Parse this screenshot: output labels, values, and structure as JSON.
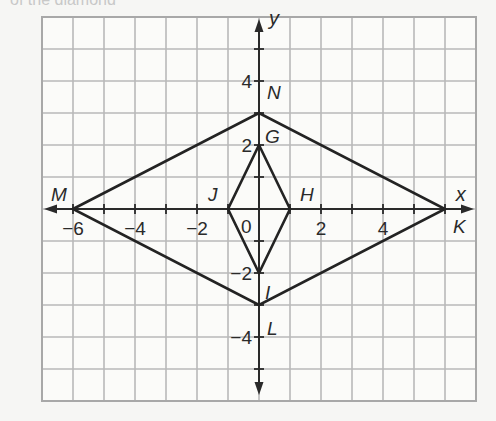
{
  "header_fragment": "of the diamond",
  "diagram": {
    "type": "coordinate-plane",
    "grid": {
      "x_min": -7,
      "x_max": 7,
      "y_min": -6,
      "y_max": 6,
      "step": 1,
      "line_color": "#b9b9b9",
      "border_color": "#a8a8a8"
    },
    "axes": {
      "x_label": "x",
      "y_label": "y",
      "color": "#2a2a2a"
    },
    "tick_labels": {
      "x": [
        {
          "value": -6,
          "text": "−6"
        },
        {
          "value": -4,
          "text": "−4"
        },
        {
          "value": -2,
          "text": "−2"
        },
        {
          "value": 2,
          "text": "2"
        },
        {
          "value": 4,
          "text": "4"
        }
      ],
      "y": [
        {
          "value": 4,
          "text": "4"
        },
        {
          "value": 2,
          "text": "2"
        },
        {
          "value": -2,
          "text": "−2"
        },
        {
          "value": -4,
          "text": "−4"
        }
      ],
      "origin": "0"
    },
    "points": [
      {
        "name": "M",
        "x": -6,
        "y": 0
      },
      {
        "name": "N",
        "x": 0,
        "y": 3
      },
      {
        "name": "K",
        "x": 6,
        "y": 0
      },
      {
        "name": "L",
        "x": 0,
        "y": -3
      },
      {
        "name": "G",
        "x": 0,
        "y": 2
      },
      {
        "name": "H",
        "x": 1,
        "y": 0
      },
      {
        "name": "I",
        "x": 0,
        "y": -2
      },
      {
        "name": "J",
        "x": -1,
        "y": 0
      }
    ],
    "polygons": [
      {
        "name": "MNKL",
        "vertices": [
          "M",
          "N",
          "K",
          "L"
        ]
      },
      {
        "name": "GHIJ",
        "vertices": [
          "G",
          "H",
          "I",
          "J"
        ]
      }
    ]
  }
}
